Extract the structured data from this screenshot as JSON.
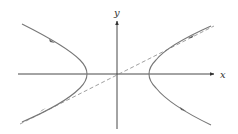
{
  "diagram": {
    "type": "hyperbola-with-asymptote",
    "axes": {
      "x_label": "x",
      "y_label": "y"
    },
    "colors": {
      "axis": "#333333",
      "curve": "#777777",
      "asymptote": "#888888",
      "label": "#333333"
    },
    "elements": [
      {
        "name": "x-axis",
        "kind": "arrow",
        "direction": "right"
      },
      {
        "name": "y-axis",
        "kind": "arrow",
        "direction": "up"
      },
      {
        "name": "left-branch",
        "kind": "curve",
        "vertex": "left of origin",
        "arrows": 2
      },
      {
        "name": "right-branch",
        "kind": "curve",
        "vertex": "right of origin",
        "arrows": 2
      },
      {
        "name": "asymptote",
        "kind": "dashed-line",
        "passes_through": "origin",
        "slope": "positive"
      }
    ]
  }
}
